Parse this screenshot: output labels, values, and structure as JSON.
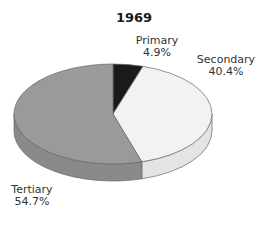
{
  "chart_data": {
    "type": "pie",
    "title": "1969",
    "style": "3d",
    "start": "top",
    "direction": "clockwise",
    "slices": [
      {
        "label": "Primary",
        "value": 4.9,
        "value_text": "4.9%",
        "color": "#1a1a1a",
        "side_color": "#111111"
      },
      {
        "label": "Secondary",
        "value": 40.4,
        "value_text": "40.4%",
        "color": "#f2f2f2",
        "side_color": "#e4e4e4"
      },
      {
        "label": "Tertiary",
        "value": 54.7,
        "value_text": "54.7%",
        "color": "#9a9a9a",
        "side_color": "#8a8a8a"
      }
    ],
    "outline_color": "#666666"
  }
}
